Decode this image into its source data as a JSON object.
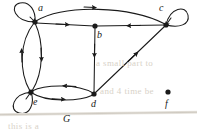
{
  "figure": {
    "caption": "G",
    "background_color": "#ffffff",
    "ink_color": "#1a1a1a",
    "width": 197,
    "height": 134
  },
  "graph": {
    "type": "directed-graph",
    "vertices": [
      {
        "id": "a",
        "label": "a",
        "x": 35,
        "y": 22,
        "label_x": 38,
        "label_y": 5
      },
      {
        "id": "b",
        "label": "b",
        "x": 95,
        "y": 26,
        "label_x": 97,
        "label_y": 31
      },
      {
        "id": "c",
        "label": "c",
        "x": 166,
        "y": 25,
        "label_x": 160,
        "label_y": 5
      },
      {
        "id": "d",
        "label": "d",
        "x": 94,
        "y": 94,
        "label_x": 92,
        "label_y": 99
      },
      {
        "id": "e",
        "label": "e",
        "x": 31,
        "y": 92,
        "label_x": 33,
        "label_y": 99
      },
      {
        "id": "f",
        "label": "f",
        "x": 168,
        "y": 92,
        "label_x": 165,
        "label_y": 99
      }
    ],
    "edges": [
      {
        "from": "a",
        "to": "a",
        "kind": "self-loop"
      },
      {
        "from": "c",
        "to": "c",
        "kind": "self-loop"
      },
      {
        "from": "e",
        "to": "e",
        "kind": "self-loop"
      },
      {
        "from": "a",
        "to": "c",
        "kind": "curved"
      },
      {
        "from": "a",
        "to": "b",
        "kind": "straight"
      },
      {
        "from": "c",
        "to": "b",
        "kind": "straight"
      },
      {
        "from": "a",
        "to": "e",
        "kind": "curved"
      },
      {
        "from": "e",
        "to": "a",
        "kind": "curved"
      },
      {
        "from": "b",
        "to": "d",
        "kind": "straight"
      },
      {
        "from": "e",
        "to": "d",
        "kind": "curved"
      },
      {
        "from": "d",
        "to": "e",
        "kind": "curved"
      },
      {
        "from": "d",
        "to": "c",
        "kind": "straight"
      }
    ],
    "isolated_vertices": [
      "f"
    ]
  },
  "artifacts": {
    "bleed_line_1": "a small part to",
    "bleed_line_2": "and 4 time be",
    "bleed_line_3": "this is a"
  }
}
